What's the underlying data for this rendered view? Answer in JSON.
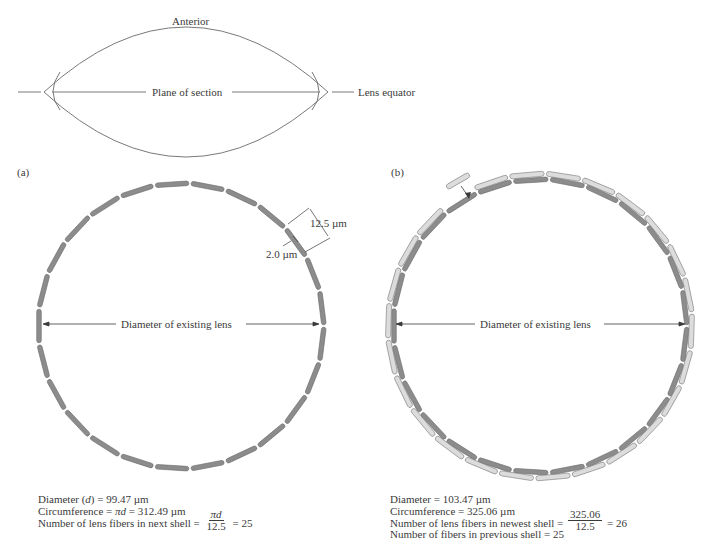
{
  "lens_overview": {
    "anterior_label": "Anterior",
    "plane_label": "Plane of section",
    "equator_label": "Lens equator"
  },
  "panel_a": {
    "label": "(a)",
    "diameter_label": "Diameter of existing lens",
    "fiber_length_label": "12.5 µm",
    "fiber_width_label": "2.0 µm",
    "fiber_count": 25,
    "fiber_color": "#8c8c8c",
    "stats": {
      "diameter_prefix": "Diameter (",
      "diameter_var": "d",
      "diameter_suffix": ") = 99.47 µm",
      "circumference_prefix": "Circumference = ",
      "circumference_var": "πd",
      "circumference_suffix": " = 312.49 µm",
      "count_prefix": "Number of lens fibers in next shell = ",
      "count_num": "πd",
      "count_den": "12.5",
      "count_result": " = 25"
    }
  },
  "panel_b": {
    "label": "(b)",
    "diameter_label": "Diameter of existing lens",
    "inner_fiber_count": 25,
    "outer_fiber_count": 26,
    "inner_fiber_color": "#8c8c8c",
    "outer_fiber_color": "#dcdcdc",
    "stats": {
      "diameter": "Diameter = 103.47 µm",
      "circumference": "Circumference = 325.06 µm",
      "count_prefix": "Number of lens fibers in newest shell = ",
      "count_num": "325.06",
      "count_den": "12.5",
      "count_result": " = 26",
      "previous": "Number of fibers in previous shell = 25"
    }
  }
}
